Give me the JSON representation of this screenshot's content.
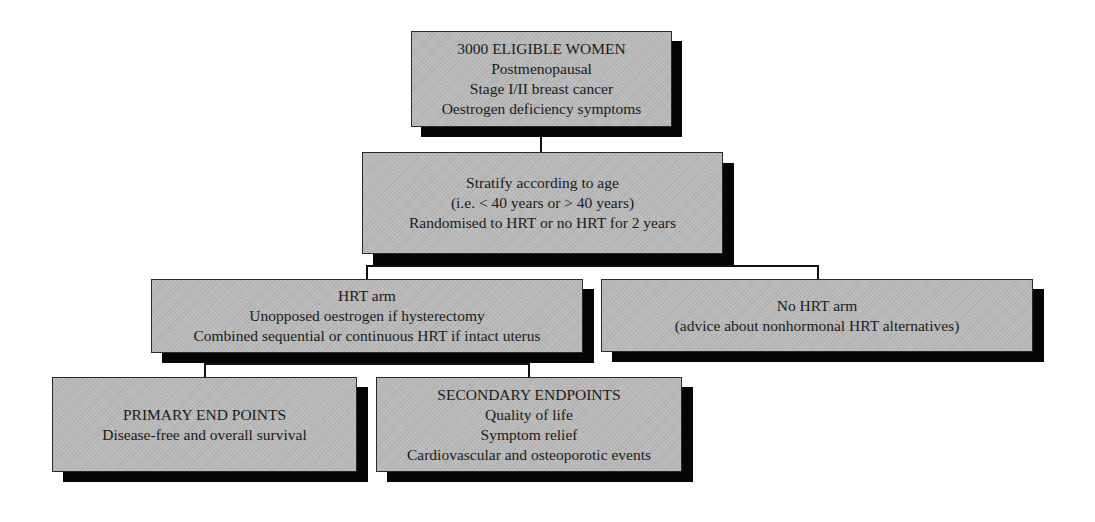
{
  "diagram": {
    "type": "flowchart",
    "nodes": [
      {
        "id": "eligible",
        "lines": [
          "3000 ELIGIBLE WOMEN",
          "Postmenopausal",
          "Stage I/II breast cancer",
          "Oestrogen deficiency symptoms"
        ]
      },
      {
        "id": "stratify",
        "lines": [
          "Stratify according to age",
          "(i.e. < 40 years or > 40 years)",
          "Randomised to HRT or no HRT for 2 years"
        ]
      },
      {
        "id": "hrt-arm",
        "lines": [
          "HRT arm",
          "Unopposed oestrogen if hysterectomy",
          "Combined sequential or continuous HRT if intact uterus"
        ]
      },
      {
        "id": "no-hrt-arm",
        "lines": [
          "No HRT arm",
          "(advice about nonhormonal HRT alternatives)"
        ]
      },
      {
        "id": "primary",
        "lines": [
          "PRIMARY END POINTS",
          "Disease-free and overall survival"
        ]
      },
      {
        "id": "secondary",
        "lines": [
          "SECONDARY ENDPOINTS",
          "Quality of life",
          "Symptom relief",
          "Cardiovascular and osteoporotic events"
        ]
      }
    ],
    "edges": [
      [
        "eligible",
        "stratify"
      ],
      [
        "stratify",
        "hrt-arm"
      ],
      [
        "stratify",
        "no-hrt-arm"
      ],
      [
        "hrt-arm",
        "primary"
      ],
      [
        "hrt-arm",
        "secondary"
      ]
    ]
  }
}
